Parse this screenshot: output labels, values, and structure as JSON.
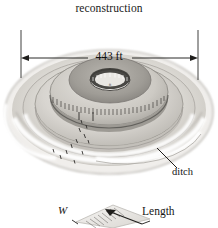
{
  "figure": {
    "title": "reconstruction",
    "dimension_label": "443 ft",
    "ditch_label": "ditch",
    "inset": {
      "width_label": "W",
      "length_label": "Length"
    },
    "icons": {
      "dimension_arrow_left": "arrow-left-icon",
      "dimension_arrow_right": "arrow-right-icon",
      "inset_arrow": "arrow-up-right-icon",
      "leader_line": "leader-line-icon"
    },
    "colors": {
      "background": "#ffffff",
      "ink": "#1c1c1c",
      "mound_light": "#e9e7e3",
      "mound_mid": "#cfccc6",
      "mound_dark": "#a9a6a0",
      "mound_shadow": "#8e8b86",
      "center_dark": "#6f6d69"
    }
  }
}
